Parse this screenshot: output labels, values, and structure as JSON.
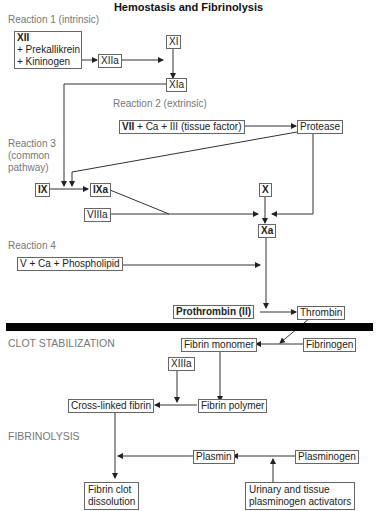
{
  "title": "Hemostasis and Fibrinolysis",
  "sections": {
    "reaction1": "Reaction 1 (intrinsic)",
    "reaction2": "Reaction 2 (extrinsic)",
    "reaction3": [
      "Reaction 3",
      "(common",
      "pathway)"
    ],
    "reaction4": "Reaction 4",
    "clot_stabilization": "CLOT STABILIZATION",
    "fibrinolysis": "FIBRINOLYSIS"
  },
  "nodes": {
    "xii_complex": {
      "head": "XII",
      "line2": "+ Prekallikrein",
      "line3": "+ Kininogen"
    },
    "xiia": "XIIa",
    "xi": "XI",
    "xia": "XIa",
    "vii_complex": {
      "bold": "VII",
      "rest": " + Ca + III (tissue factor)"
    },
    "protease": "Protease",
    "ix": "IX",
    "ixa": "IXa",
    "viiia": "VIIIa",
    "x": "X",
    "xa": "Xa",
    "v_complex": "V + Ca + Phospholipid",
    "prothrombin": "Prothrombin (II)",
    "thrombin": "Thrombin",
    "fibrin_monomer": "Fibrin monomer",
    "fibrinogen": "Fibrinogen",
    "xiiia": "XIIIa",
    "cross_linked_fibrin": "Cross-linked fibrin",
    "fibrin_polymer": "Fibrin polymer",
    "plasmin": "Plasmin",
    "plasminogen": "Plasminogen",
    "fibrin_clot_dissolution": [
      "Fibrin clot",
      "dissolution"
    ],
    "activators": [
      "Urinary and tissue",
      "plasminogen activators"
    ]
  },
  "colors": {
    "line": "#333333",
    "box_border": "#666666",
    "label": "#777777",
    "divider": "#000000"
  }
}
